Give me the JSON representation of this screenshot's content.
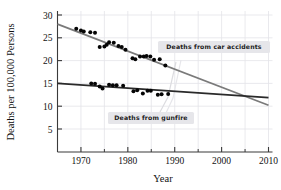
{
  "chart_data": {
    "type": "scatter",
    "title": "",
    "xlabel": "Year",
    "ylabel": "Deaths per 100,000 Persons",
    "xlim": [
      1965,
      2010
    ],
    "ylim": [
      0,
      31
    ],
    "xticks": [
      1970,
      1980,
      1990,
      2000,
      2010
    ],
    "xtick_labels": [
      "1970",
      "1980",
      "1990",
      "2000",
      "2010"
    ],
    "xminor_ticks": [
      1965,
      1975,
      1985,
      1995,
      2005
    ],
    "yticks": [
      5,
      10,
      15,
      20,
      25,
      30
    ],
    "ytick_labels": [
      "5",
      "10",
      "15",
      "20",
      "25",
      "30"
    ],
    "grid": true,
    "legend_position": "inline-annotations",
    "annotations": [
      {
        "text": "Deaths from car accidents",
        "x": 1992,
        "y": 22.5
      },
      {
        "text": "Deaths from gunfire",
        "x": 1981,
        "y": 11.0
      }
    ],
    "series": [
      {
        "name": "Deaths from car accidents",
        "color": "#7a7a7a",
        "point_color": "#050505",
        "trend_start": {
          "x": 1965,
          "y": 28.0
        },
        "trend_end": {
          "x": 2010,
          "y": 10.2
        },
        "points": [
          {
            "x": 1969,
            "y": 27.0
          },
          {
            "x": 1970,
            "y": 26.6
          },
          {
            "x": 1970.6,
            "y": 26.4
          },
          {
            "x": 1972,
            "y": 26.2
          },
          {
            "x": 1973,
            "y": 26.1
          },
          {
            "x": 1974,
            "y": 23.0
          },
          {
            "x": 1975,
            "y": 23.1
          },
          {
            "x": 1975.5,
            "y": 23.5
          },
          {
            "x": 1976,
            "y": 24.0
          },
          {
            "x": 1977,
            "y": 23.9
          },
          {
            "x": 1978,
            "y": 23.2
          },
          {
            "x": 1978.7,
            "y": 23.0
          },
          {
            "x": 1979.5,
            "y": 22.4
          },
          {
            "x": 1981,
            "y": 20.5
          },
          {
            "x": 1981.6,
            "y": 20.3
          },
          {
            "x": 1982.6,
            "y": 20.9
          },
          {
            "x": 1983.4,
            "y": 20.9
          },
          {
            "x": 1984,
            "y": 21.0
          },
          {
            "x": 1984.8,
            "y": 20.9
          },
          {
            "x": 1985.6,
            "y": 20.2
          },
          {
            "x": 1986.8,
            "y": 20.3
          },
          {
            "x": 1988,
            "y": 18.9
          }
        ]
      },
      {
        "name": "Deaths from gunfire",
        "color": "#2a2a2a",
        "point_color": "#050505",
        "trend_start": {
          "x": 1965,
          "y": 15.0
        },
        "trend_end": {
          "x": 2010,
          "y": 11.9
        },
        "points": [
          {
            "x": 1972.2,
            "y": 15.0
          },
          {
            "x": 1973.0,
            "y": 14.9
          },
          {
            "x": 1974.0,
            "y": 14.3
          },
          {
            "x": 1974.6,
            "y": 13.9
          },
          {
            "x": 1976.0,
            "y": 14.7
          },
          {
            "x": 1976.8,
            "y": 14.6
          },
          {
            "x": 1977.6,
            "y": 14.6
          },
          {
            "x": 1979.0,
            "y": 14.5
          },
          {
            "x": 1981.2,
            "y": 13.3
          },
          {
            "x": 1982.0,
            "y": 13.5
          },
          {
            "x": 1983.2,
            "y": 12.8
          },
          {
            "x": 1984.2,
            "y": 13.4
          },
          {
            "x": 1984.9,
            "y": 13.4
          },
          {
            "x": 1986.4,
            "y": 12.5
          },
          {
            "x": 1987.2,
            "y": 12.6
          },
          {
            "x": 1988.6,
            "y": 12.7
          }
        ]
      }
    ]
  },
  "colors": {
    "grid": "#e3e3e8",
    "axis": "#3a3a3a",
    "annotation_box": "#e6e6ea",
    "car_line": "#7a7a7a",
    "gun_line": "#2a2a2a",
    "point": "#050505"
  }
}
